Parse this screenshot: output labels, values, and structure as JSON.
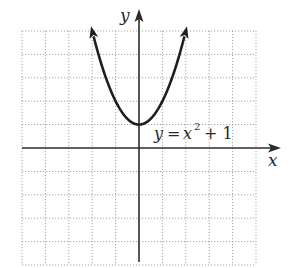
{
  "chart_data": {
    "type": "line",
    "title": "",
    "function": "y = x^2 + 1",
    "series": [
      {
        "name": "y = x² + 1",
        "x": [
          -2,
          -1.5,
          -1,
          -0.5,
          0,
          0.5,
          1,
          1.5,
          2
        ],
        "y": [
          5,
          3.25,
          2,
          1.25,
          1,
          1.25,
          2,
          3.25,
          5
        ],
        "arrows_at_ends": true
      }
    ],
    "vertex": [
      0,
      1
    ],
    "xlabel": "x",
    "ylabel": "y",
    "xlim": [
      -5,
      5
    ],
    "ylim": [
      -5,
      5
    ],
    "grid": true,
    "grid_style": "dotted",
    "grid_step": 1,
    "tick_labels": false,
    "annotations": [
      {
        "text_parts": [
          "y",
          " = ",
          "x",
          "2",
          " + 1"
        ],
        "position": [
          0.7,
          0.7
        ]
      }
    ]
  },
  "labels": {
    "x_axis": "x",
    "y_axis": "y",
    "curve_eq_y": "y",
    "curve_eq_eq": "=",
    "curve_eq_x": "x",
    "curve_eq_exp": "2",
    "curve_eq_rest": "+ 1"
  },
  "colors": {
    "axis": "#2b2b2b",
    "curve": "#1e1e1e",
    "grid": "#9a9a9a",
    "background": "#ffffff"
  }
}
